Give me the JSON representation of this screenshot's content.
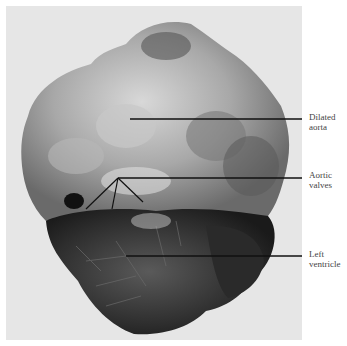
{
  "figure": {
    "background_color": "#e6e6e6",
    "labels": [
      {
        "id": "dilated-aorta",
        "lines": [
          "Dilated",
          "aorta"
        ]
      },
      {
        "id": "aortic-valves",
        "lines": [
          "Aortic",
          "valves"
        ]
      },
      {
        "id": "left-ventricle",
        "lines": [
          "Left",
          "ventricle"
        ]
      }
    ]
  }
}
